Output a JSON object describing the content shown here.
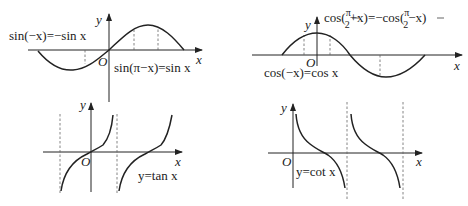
{
  "panels": [
    {
      "name": "sine",
      "equation": "sin(−x)=−sin x",
      "equation2": "sin(π−x)=sin x",
      "x_label": "x",
      "y_label": "y",
      "origin_label": "O"
    },
    {
      "name": "cosine",
      "equation_top_prefix": "cos(",
      "equation_top_frac_num": "π",
      "equation_top_frac_den": "2",
      "equation_top_mid": "+x)=−cos(",
      "equation_top_frac2_num": "π",
      "equation_top_frac2_den": "2",
      "equation_top_suffix": "−x)",
      "equation_bottom": "cos(−x)=cos x",
      "x_label": "x",
      "y_label": "y",
      "origin_label": "O"
    },
    {
      "name": "tangent",
      "equation": "y=tan x",
      "x_label": "x",
      "y_label": "y",
      "origin_label": "O"
    },
    {
      "name": "cotangent",
      "equation": "y=cot x",
      "x_label": "x",
      "y_label": "y",
      "origin_label": "O"
    }
  ],
  "colors": {
    "stroke": "#222222",
    "dash": "#666666",
    "background": "#ffffff"
  }
}
